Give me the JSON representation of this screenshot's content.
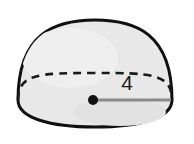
{
  "figure": {
    "name": "hemisphere-solid",
    "shape_kind": "hemisphere",
    "background_color": "#ffffff",
    "fill_color": "#e8e8e8",
    "outline_color": "#101010",
    "outline_width_px": 3,
    "hidden_edge_style": "dashed",
    "hidden_edge_color": "#1a1a1a",
    "radius": {
      "label": "4",
      "label_color": "#1a1a1a",
      "line_color": "#8a8a8a",
      "center_dot_color": "#111111",
      "center_point": {
        "x": 93,
        "y": 100
      },
      "end_point": {
        "x": 170,
        "y": 100
      }
    },
    "geometry": {
      "apex": {
        "x": 95,
        "y": 20
      },
      "left_extent_x": 18,
      "right_extent_x": 172,
      "base_center": {
        "x": 95,
        "y": 100
      },
      "base_semi_axis_x": 77,
      "base_semi_axis_y": 27,
      "bottom_extent_y": 127
    }
  }
}
